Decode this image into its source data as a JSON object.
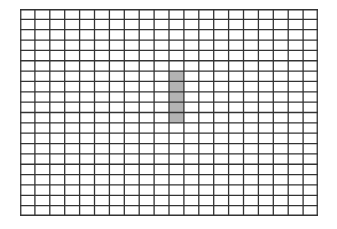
{
  "grid": {
    "columns": 20,
    "rows": 20,
    "line_color": "#333333",
    "background": "#ffffff",
    "highlight": {
      "color": "#b3b3b3",
      "column": 10,
      "row_start": 6,
      "row_end": 10
    }
  }
}
